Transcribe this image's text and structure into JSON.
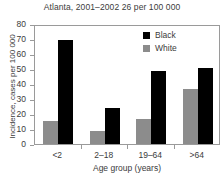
{
  "chart_data": {
    "type": "bar",
    "title": "Atlanta, 2001–2002 26 per 100 000",
    "xlabel": "Age group (years)",
    "ylabel": "Incidence, cases per 100 000",
    "categories": [
      "<2",
      "2–18",
      "19–64",
      ">64"
    ],
    "series": [
      {
        "name": "Black",
        "color": "#000000",
        "values": [
          69.5,
          24,
          48.5,
          51
        ]
      },
      {
        "name": "White",
        "color": "#8c8c8c",
        "values": [
          15.5,
          8.5,
          16.5,
          37
        ]
      }
    ],
    "series_order": [
      "White",
      "Black"
    ],
    "ylim": [
      0,
      80
    ],
    "yticks": [
      0,
      10,
      20,
      30,
      40,
      50,
      60,
      70,
      80
    ],
    "ytick_labels": [
      "0",
      "10",
      "20",
      "30",
      "40",
      "50",
      "60",
      "70",
      "80"
    ],
    "grid": false,
    "legend_position": "top-right",
    "legend": [
      {
        "label": "Black",
        "color": "#000000"
      },
      {
        "label": "White",
        "color": "#8c8c8c"
      }
    ]
  }
}
